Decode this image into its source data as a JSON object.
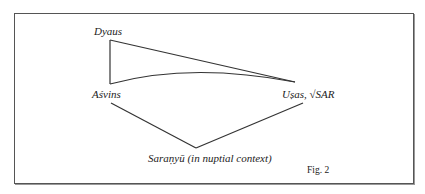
{
  "figure": {
    "caption": "Fig. 2",
    "nodes": {
      "dyaus": "Dyaus",
      "asvins": "Aśvins",
      "usas": "Uṣas, √SAR",
      "saranyu": "Saraṇyū (in nuptial context)"
    },
    "edges": [
      {
        "from": "Dyaus",
        "to": "Aśvins",
        "style": "straight"
      },
      {
        "from": "Dyaus",
        "to": "Uṣas, √SAR",
        "style": "straight"
      },
      {
        "from": "Aśvins",
        "to": "Uṣas, √SAR",
        "style": "curved"
      },
      {
        "from": "Aśvins",
        "to": "Saraṇyū (in nuptial context)",
        "style": "straight"
      },
      {
        "from": "Uṣas, √SAR",
        "to": "Saraṇyū (in nuptial context)",
        "style": "straight"
      }
    ],
    "colors": {
      "line": "#333333",
      "frame": "#555555",
      "text": "#222222"
    }
  }
}
